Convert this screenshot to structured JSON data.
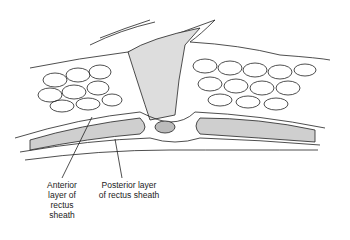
{
  "figure": {
    "labels": [
      {
        "id": "anterior",
        "text": "Anterior\nlayer of\nrectus\nsheath"
      },
      {
        "id": "posterior",
        "text": "Posterior layer\nof rectus sheath"
      }
    ],
    "colors": {
      "line": "#222222",
      "background": "#ffffff"
    }
  }
}
